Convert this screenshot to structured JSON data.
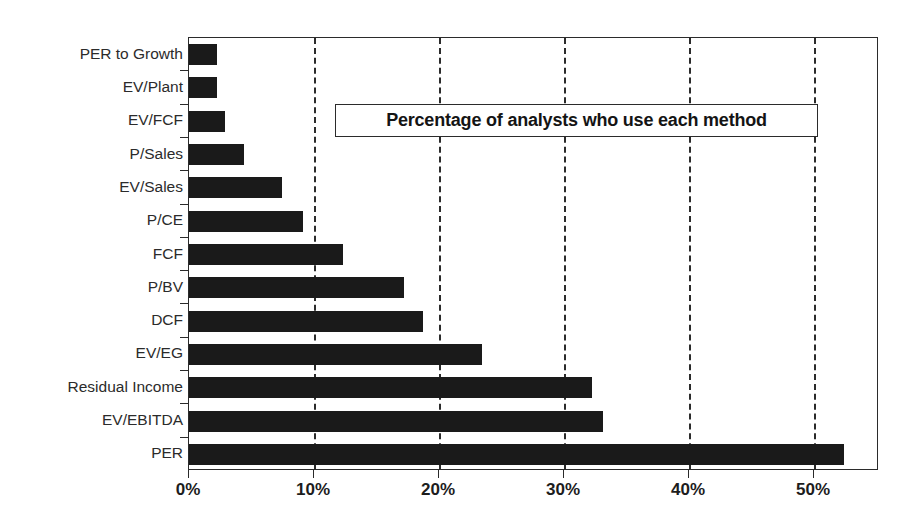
{
  "legend": {
    "text": "Percentage of analysts who use each method"
  },
  "axis": {
    "xticklabels": [
      "0%",
      "10%",
      "20%",
      "30%",
      "40%",
      "50%"
    ],
    "xtickvalues": [
      0,
      10,
      20,
      30,
      40,
      50
    ]
  },
  "colors": {
    "bar": "#1a1a1a",
    "axis": "#2b2b2b",
    "background": "#ffffff"
  },
  "chart_data": {
    "type": "bar",
    "orientation": "horizontal",
    "title": "Percentage of analysts who use each method",
    "xlabel": "",
    "ylabel": "",
    "xlim": [
      0,
      55.2
    ],
    "xticks": [
      0,
      10,
      20,
      30,
      40,
      50
    ],
    "xticklabels": [
      "0%",
      "10%",
      "20%",
      "30%",
      "40%",
      "50%"
    ],
    "grid": "vertical-dashed",
    "legend": "none",
    "categories": [
      "PER to Growth",
      "EV/Plant",
      "EV/FCF",
      "P/Sales",
      "EV/Sales",
      "P/CE",
      "FCF",
      "P/BV",
      "DCF",
      "EV/EG",
      "Residual Income",
      "EV/EBITDA",
      "PER"
    ],
    "values": [
      2.2,
      2.2,
      2.9,
      4.4,
      7.4,
      9.1,
      12.3,
      17.2,
      18.7,
      23.4,
      32.2,
      33.1,
      52.4
    ],
    "value_unit": "percent"
  }
}
